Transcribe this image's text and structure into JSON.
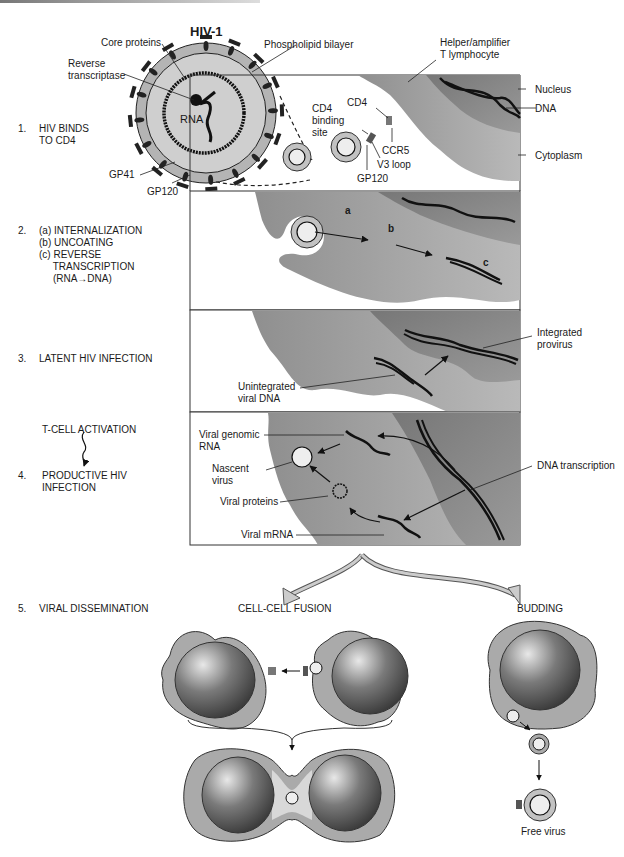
{
  "figure": {
    "title": "HIV-1",
    "virion_labels": {
      "core_proteins": "Core proteins",
      "phospholipid_bilayer": "Phospholipid bilayer",
      "reverse_transcriptase": "Reverse\ntranscriptase",
      "rna": "RNA",
      "gp41": "GP41",
      "gp120": "GP120"
    },
    "cell_labels": {
      "helper_t": "Helper/amplifier\nT lymphocyte",
      "nucleus": "Nucleus",
      "dna": "DNA",
      "cytoplasm": "Cytoplasm",
      "cd4": "CD4",
      "cd4_binding_site": "CD4\nbinding\nsite",
      "ccr5": "CCR5",
      "v3_loop": "V3 loop",
      "gp120_panel": "GP120"
    },
    "steps": [
      {
        "num": "1.",
        "text": "HIV BINDS\nTO CD4"
      },
      {
        "num": "2.",
        "text": "(a) INTERNALIZATION\n(b) UNCOATING\n(c) REVERSE\n     TRANSCRIPTION\n     (RNA→DNA)"
      },
      {
        "num": "3.",
        "text": "LATENT HIV INFECTION"
      },
      {
        "num": "4.",
        "text": "PRODUCTIVE HIV\nINFECTION"
      },
      {
        "num": "5.",
        "text": "VIRAL DISSEMINATION"
      }
    ],
    "activation_label": "T-CELL ACTIVATION",
    "panel2_markers": {
      "a": "a",
      "b": "b",
      "c": "c"
    },
    "panel3_labels": {
      "integrated": "Integrated\nprovirus",
      "unintegrated": "Unintegrated\nviral DNA"
    },
    "panel4_labels": {
      "viral_genomic_rna": "Viral genomic\nRNA",
      "nascent_virus": "Nascent\nvirus",
      "viral_proteins": "Viral proteins",
      "viral_mrna": "Viral mRNA",
      "dna_transcription": "DNA transcription"
    },
    "dissemination": {
      "fusion": "CELL-CELL FUSION",
      "budding": "BUDDING",
      "free_virus": "Free virus"
    }
  }
}
